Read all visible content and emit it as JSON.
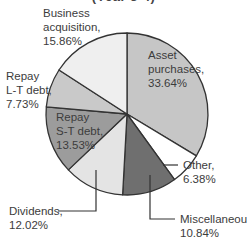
{
  "chart_data": {
    "type": "pie",
    "title": "(Year 3-4)",
    "start_angle_deg": -90,
    "direction": "clockwise",
    "slices": [
      {
        "label": "Asset purchases",
        "value": 33.64,
        "display": "33.64%",
        "color": "#c6c6c6"
      },
      {
        "label": "Other",
        "value": 6.38,
        "display": "6.38%",
        "color": "#ffffff"
      },
      {
        "label": "Miscellaneous",
        "value": 10.84,
        "display": "10.84%",
        "color": "#6f6f6f"
      },
      {
        "label": "Dividends",
        "value": 12.02,
        "display": "12.02%",
        "color": "#e4e4e4"
      },
      {
        "label": "Repay S-T debt",
        "value": 13.53,
        "display": "13.53%",
        "color": "#9c9c9c"
      },
      {
        "label": "Repay L-T debt",
        "value": 7.73,
        "display": "7.73%",
        "color": "#c9c9c9"
      },
      {
        "label": "Business acquisition",
        "value": 15.86,
        "display": "15.86%",
        "color": "#efefef"
      }
    ],
    "units": "%",
    "legend": "none (direct labels)"
  },
  "labels": {
    "asset": {
      "line1": "Asset",
      "line2": "purchases,",
      "line3": "33.64%"
    },
    "other": {
      "line1": "Other,",
      "line2": "6.38%"
    },
    "misc": {
      "line1": "Miscellaneous,",
      "line2": "10.84%"
    },
    "dividends": {
      "line1": "Dividends,",
      "line2": "12.02%"
    },
    "st_debt": {
      "line1": "Repay",
      "line2": "S-T debt,",
      "line3": "13.53%"
    },
    "lt_debt": {
      "line1": "Repay",
      "line2": "L-T debt,",
      "line3": "7.73%"
    },
    "business": {
      "line1": "Business",
      "line2": "acquisition,",
      "line3": "15.86%"
    }
  },
  "geometry": {
    "cx": 127,
    "cy": 114,
    "r": 81,
    "stroke": "#333333"
  }
}
